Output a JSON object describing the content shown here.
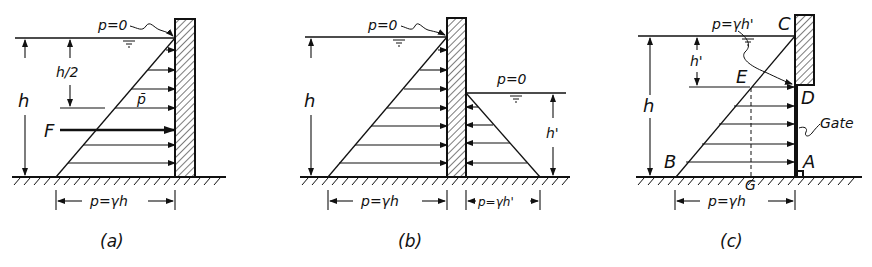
{
  "figure": {
    "colors": {
      "ink": "#111111",
      "background": "#ffffff"
    },
    "panels": [
      {
        "id": "a",
        "caption": "(a)",
        "labels": {
          "surface_pressure": "p=0",
          "depth": "h",
          "half_depth": "h/2",
          "mean_pressure": "p̄",
          "force": "F",
          "base_pressure": "p=γh"
        }
      },
      {
        "id": "b",
        "caption": "(b)",
        "labels": {
          "surface_pressure_left": "p=0",
          "surface_pressure_right": "p=0",
          "depth_left": "h",
          "depth_right": "h'",
          "base_pressure_left": "p=γh",
          "base_pressure_right": "p=γh'"
        }
      },
      {
        "id": "c",
        "caption": "(c)",
        "labels": {
          "pressure_at_D": "p=γh'",
          "depth": "h",
          "depth_to_gate": "h'",
          "point_C": "C",
          "point_D": "D",
          "point_E": "E",
          "point_B": "B",
          "point_A": "A",
          "point_G": "G",
          "gate": "Gate",
          "base_pressure": "p=γh"
        }
      }
    ]
  }
}
